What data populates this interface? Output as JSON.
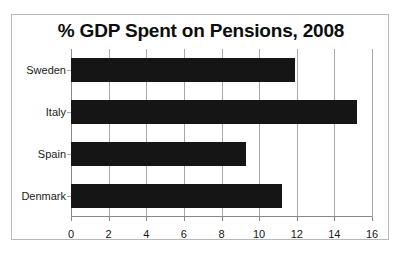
{
  "chart_data": {
    "type": "bar",
    "orientation": "horizontal",
    "title": "% GDP Spent on Pensions, 2008",
    "categories": [
      "Sweden",
      "Italy",
      "Spain",
      "Denmark"
    ],
    "values": [
      11.9,
      15.2,
      9.3,
      11.2
    ],
    "xlabel": "",
    "ylabel": "",
    "xlim": [
      0,
      16
    ],
    "xticks": [
      "0",
      "2",
      "4",
      "6",
      "8",
      "10",
      "12",
      "14",
      "16"
    ],
    "xtick_values": [
      0,
      2,
      4,
      6,
      8,
      10,
      12,
      14,
      16
    ],
    "grid": true,
    "legend": false,
    "bar_color": "#151515",
    "gridline_color": "#a8a8a8",
    "frame_color": "#b9b9b9",
    "background": "#ffffff"
  }
}
